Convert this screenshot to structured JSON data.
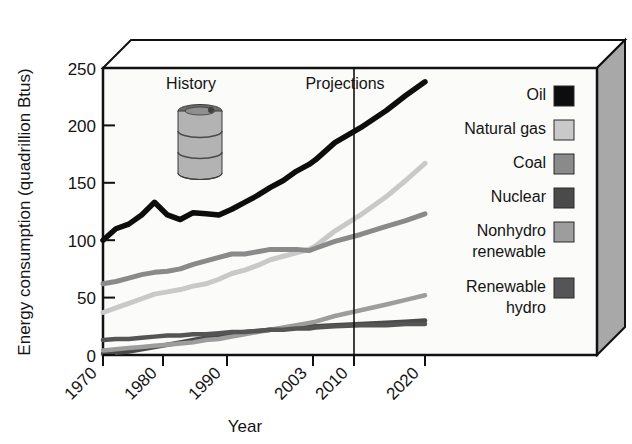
{
  "chart_data": {
    "type": "line",
    "title": "",
    "xlabel": "Year",
    "ylabel": "Energy consumption (quadrillion Btus)",
    "xlim": [
      1970,
      2023
    ],
    "ylim": [
      0,
      250
    ],
    "xticks": [
      "1970",
      "1980",
      "1990",
      "2003",
      "2010",
      "2020"
    ],
    "xtick_values": [
      1970,
      1980,
      1990,
      2003,
      2010,
      2020
    ],
    "yticks": [
      "0",
      "50",
      "100",
      "150",
      "200",
      "250"
    ],
    "ytick_values": [
      0,
      50,
      100,
      150,
      200,
      250
    ],
    "grid": false,
    "legend_position": "right",
    "annotations": [
      {
        "text": "History",
        "x": 1981,
        "y": 232
      },
      {
        "text": "Projections",
        "x": 2004,
        "y": 232
      }
    ],
    "divider": {
      "label": "projection-start",
      "x": 2010
    },
    "x": [
      1970,
      1972,
      1974,
      1976,
      1978,
      1980,
      1982,
      1984,
      1986,
      1988,
      1990,
      1992,
      1994,
      1996,
      1998,
      2000,
      2002,
      2003,
      2006,
      2010,
      2014,
      2017,
      2020
    ],
    "series": [
      {
        "name": "Oil",
        "color": "#0d0d0d",
        "values": [
          100,
          110,
          114,
          122,
          133,
          122,
          118,
          124,
          123,
          122,
          127,
          133,
          139,
          146,
          152,
          160,
          166,
          170,
          185,
          198,
          213,
          226,
          238
        ]
      },
      {
        "name": "Natural gas",
        "color": "#c9c9c9",
        "values": [
          37,
          41,
          45,
          49,
          53,
          55,
          57,
          60,
          62,
          66,
          71,
          74,
          78,
          83,
          86,
          89,
          92,
          95,
          108,
          122,
          138,
          152,
          167
        ]
      },
      {
        "name": "Coal",
        "color": "#8a8a8a",
        "values": [
          62,
          64,
          67,
          70,
          72,
          73,
          75,
          79,
          82,
          85,
          88,
          88,
          90,
          92,
          92,
          92,
          91,
          93,
          99,
          105,
          112,
          117,
          123
        ]
      },
      {
        "name": "Nuclear",
        "color": "#4a4a4a",
        "values": [
          1,
          2,
          3,
          5,
          7,
          9,
          11,
          13,
          15,
          17,
          19,
          20,
          21,
          22,
          23,
          24,
          25,
          25,
          26,
          27,
          28,
          29,
          30
        ]
      },
      {
        "name": "Nonhydro renewable",
        "color": "#9d9d9d",
        "values": [
          4,
          5,
          6,
          7,
          8,
          9,
          10,
          11,
          13,
          14,
          16,
          18,
          20,
          22,
          24,
          26,
          28,
          29,
          34,
          39,
          44,
          48,
          52
        ]
      },
      {
        "name": "Renewable hydro",
        "color": "#555555",
        "values": [
          13,
          14,
          14,
          15,
          16,
          17,
          17,
          18,
          18,
          19,
          20,
          20,
          21,
          22,
          22,
          23,
          23,
          24,
          25,
          26,
          26,
          27,
          27
        ]
      }
    ],
    "legend": [
      {
        "label": "Oil",
        "color": "#0d0d0d"
      },
      {
        "label": "Natural gas",
        "color": "#c9c9c9"
      },
      {
        "label": "Coal",
        "color": "#8a8a8a"
      },
      {
        "label": "Nuclear",
        "color": "#4a4a4a"
      },
      {
        "label": "Nonhydro renewable",
        "color": "#9d9d9d"
      },
      {
        "label": "Renewable hydro",
        "color": "#555555"
      }
    ],
    "decoration": {
      "icon": "oil-barrel-icon"
    }
  },
  "labels": {
    "y_axis_title": "Energy consumption (quadrillion Btus)",
    "x_axis_title": "Year",
    "history": "History",
    "projections": "Projections",
    "ytick_0": "0",
    "ytick_50": "50",
    "ytick_100": "100",
    "ytick_150": "150",
    "ytick_200": "200",
    "ytick_250": "250",
    "xtick_1970": "1970",
    "xtick_1980": "1980",
    "xtick_1990": "1990",
    "xtick_2003": "2003",
    "xtick_2010": "2010",
    "xtick_2020": "2020",
    "legend_oil": "Oil",
    "legend_natural_gas": "Natural gas",
    "legend_coal": "Coal",
    "legend_nuclear": "Nuclear",
    "legend_nonhydro_1": "Nonhydro",
    "legend_nonhydro_2": "renewable",
    "legend_hydro_1": "Renewable",
    "legend_hydro_2": "hydro"
  },
  "colors": {
    "oil": "#0d0d0d",
    "natural_gas": "#c9c9c9",
    "coal": "#8a8a8a",
    "nuclear": "#4a4a4a",
    "nonhydro": "#9d9d9d",
    "hydro": "#555555",
    "plot_bg": "#fbfbfa",
    "box_side": "#a8a8a8",
    "box_top": "#ffffff",
    "axis": "#111111"
  }
}
